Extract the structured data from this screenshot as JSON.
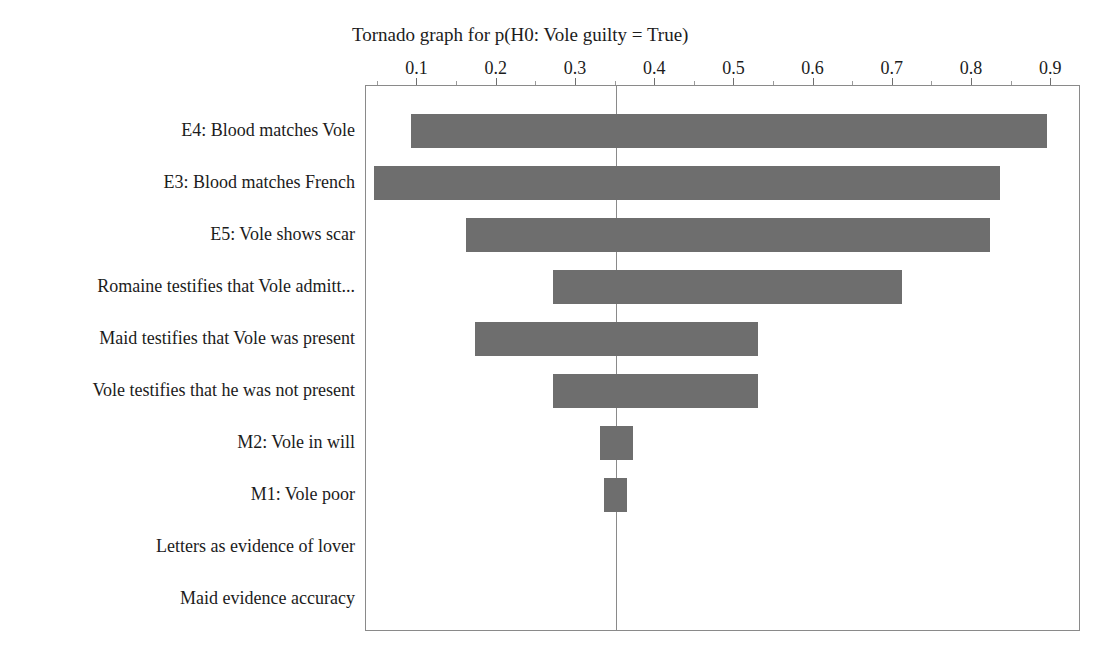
{
  "chart_data": {
    "type": "bar",
    "subtype": "tornado",
    "title": "Tornado graph for p(H0: Vole guilty = True)",
    "xlabel": "",
    "ylabel": "",
    "xlim": [
      0.035,
      0.9375
    ],
    "xticks": [
      0.1,
      0.2,
      0.3,
      0.4,
      0.5,
      0.6,
      0.7,
      0.8,
      0.9
    ],
    "xticklabels": [
      "0.1",
      "0.2",
      "0.3",
      "0.4",
      "0.5",
      "0.6",
      "0.7",
      "0.8",
      "0.9"
    ],
    "base_value": 0.35,
    "grid": false,
    "legend": false,
    "bar_color": "#6e6e6e",
    "frame_color": "#8a8a8a",
    "categories": [
      "E4: Blood matches Vole",
      "E3: Blood matches French",
      "E5: Vole shows scar",
      "Romaine testifies that Vole admitt...",
      "Maid testifies that Vole was present",
      "Vole testifies that he was not present",
      "M2: Vole in will",
      "M1: Vole poor",
      "Letters as evidence of lover",
      "Maid evidence accuracy"
    ],
    "low": [
      0.092,
      0.045,
      0.161,
      0.271,
      0.172,
      0.271,
      0.33,
      0.335,
      0.35,
      0.35
    ],
    "high": [
      0.895,
      0.835,
      0.823,
      0.712,
      0.53,
      0.53,
      0.372,
      0.365,
      0.35,
      0.35
    ]
  }
}
